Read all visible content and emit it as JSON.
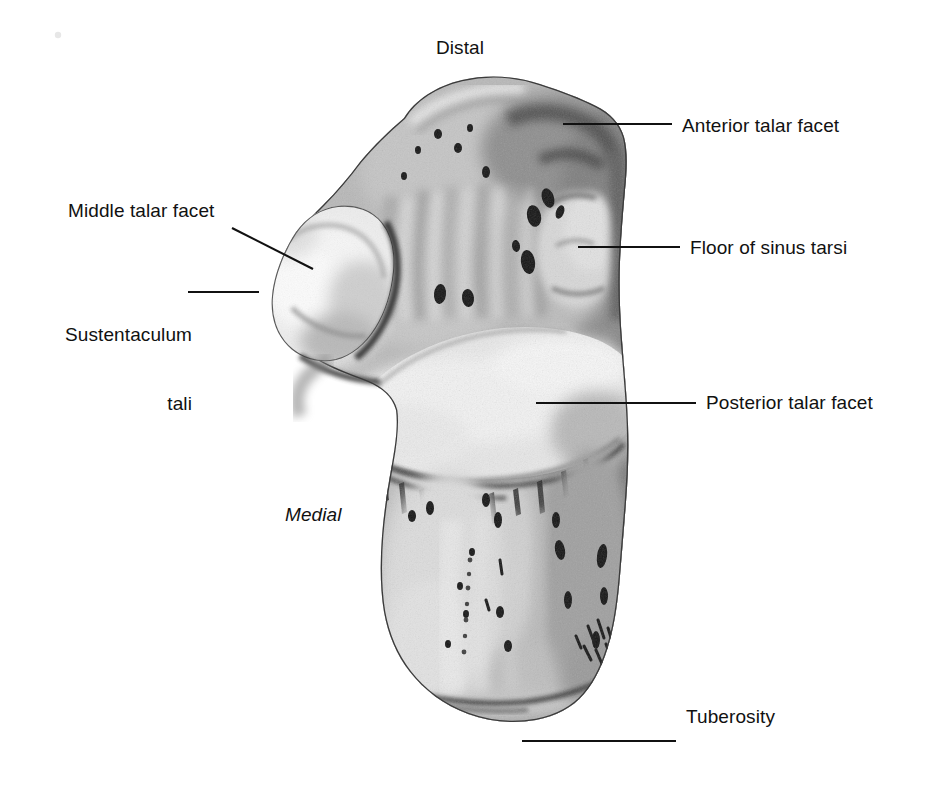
{
  "figure": {
    "background_color": "#ffffff",
    "line_color": "#111111",
    "orientation_labels": {
      "distal": "Distal",
      "medial": "Medial"
    }
  },
  "annotations": [
    {
      "id": "anterior-talar-facet",
      "label": "Anterior talar facet",
      "side": "right"
    },
    {
      "id": "floor-of-sinus-tarsi",
      "label": "Floor of sinus tarsi",
      "side": "right"
    },
    {
      "id": "posterior-talar-facet",
      "label": "Posterior talar facet",
      "side": "right"
    },
    {
      "id": "tuberosity",
      "label": "Tuberosity",
      "side": "right"
    },
    {
      "id": "middle-talar-facet",
      "label": "Middle talar facet",
      "side": "left"
    },
    {
      "id": "sustentaculum-tali",
      "label": "Sustentaculum\ntali",
      "side": "left"
    }
  ],
  "labels": {
    "distal": "Distal",
    "medial": "Medial",
    "anterior_talar_facet": "Anterior talar facet",
    "floor_of_sinus_tarsi": "Floor of sinus tarsi",
    "posterior_talar_facet": "Posterior talar facet",
    "tuberosity": "Tuberosity",
    "middle_talar_facet": "Middle talar facet",
    "sustentaculum_tali_line1": "Sustentaculum",
    "sustentaculum_tali_line2": "tali"
  }
}
